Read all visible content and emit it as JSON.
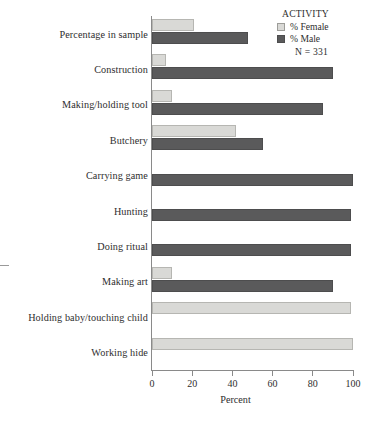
{
  "chart_data": {
    "type": "bar",
    "orientation": "horizontal",
    "grouped": true,
    "title": "",
    "xlabel": "Percent",
    "ylabel": "",
    "xlim": [
      0,
      100
    ],
    "xticks": [
      0,
      20,
      40,
      60,
      80,
      100
    ],
    "grid": false,
    "legend_position": "top-right",
    "legend_title": "ACTIVITY",
    "sample_note": "N = 331",
    "categories": [
      "Percentage in sample",
      "Construction",
      "Making/holding tool",
      "Butchery",
      "Carrying game",
      "Hunting",
      "Doing ritual",
      "Making art",
      "Holding baby/touching child",
      "Working hide"
    ],
    "series": [
      {
        "name": "% Female",
        "color": "#d9d9d6",
        "values": [
          21,
          7,
          10,
          42,
          0,
          0,
          0,
          10,
          99,
          100
        ]
      },
      {
        "name": "% Male",
        "color": "#5a5a5b",
        "values": [
          48,
          90,
          85,
          55,
          100,
          99,
          99,
          90,
          0,
          0
        ]
      }
    ]
  },
  "legend": {
    "title": "ACTIVITY",
    "items": [
      {
        "label": "% Female",
        "swatch": "female"
      },
      {
        "label": "% Male",
        "swatch": "male"
      }
    ],
    "n_label": "N = 331"
  },
  "axis": {
    "x_title": "Percent",
    "x_ticks": [
      "0",
      "20",
      "40",
      "60",
      "80",
      "100"
    ]
  }
}
